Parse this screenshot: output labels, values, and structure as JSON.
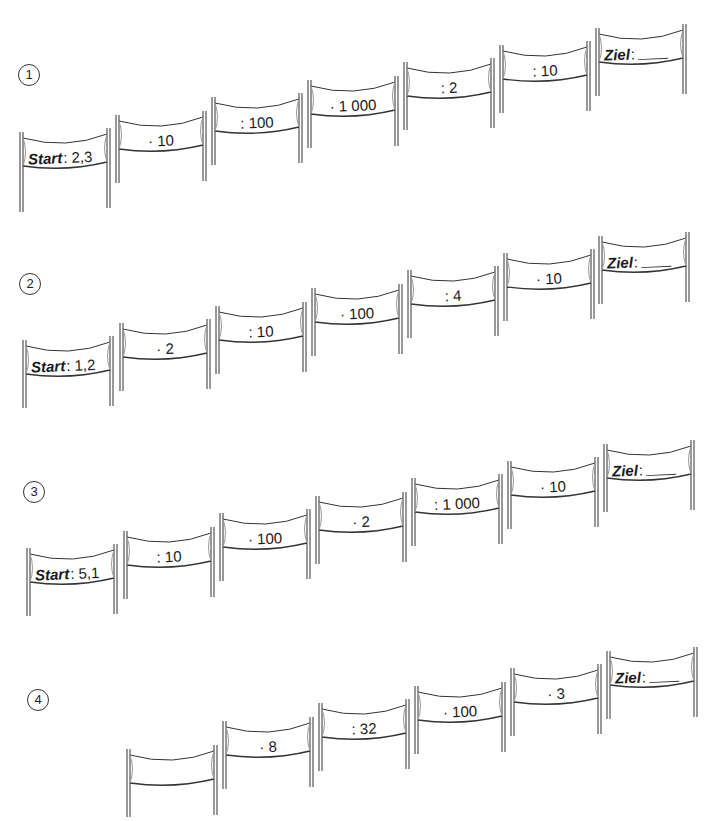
{
  "worksheet": {
    "rows": [
      {
        "number": "1",
        "start_label": "Start",
        "start_value": "2,3",
        "operations": [
          "· 10",
          ": 100",
          "· 1 000",
          ": 2",
          ": 10"
        ],
        "goal_label": "Ziel",
        "goal_value": ""
      },
      {
        "number": "2",
        "start_label": "Start",
        "start_value": "1,2",
        "operations": [
          "· 2",
          ": 10",
          "· 100",
          ": 4",
          "· 10"
        ],
        "goal_label": "Ziel",
        "goal_value": ""
      },
      {
        "number": "3",
        "start_label": "Start",
        "start_value": "5,1",
        "operations": [
          ": 10",
          "· 100",
          "· 2",
          ": 1 000",
          "· 10"
        ],
        "goal_label": "Ziel",
        "goal_value": ""
      },
      {
        "number": "4",
        "start_label": "",
        "start_value": "",
        "operations": [
          "",
          "· 8",
          ": 32",
          "· 100",
          "· 3"
        ],
        "goal_label": "Ziel",
        "goal_value": ""
      }
    ],
    "colon": ":",
    "line_color": "#333333"
  }
}
